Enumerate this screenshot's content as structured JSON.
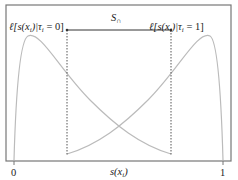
{
  "figure": {
    "label_left": "ℓ[s(x",
    "label_left_sub": "i",
    "label_left_mid": ")|τ",
    "label_left_sub2": "i",
    "label_left_end": " = 0]",
    "label_right": "ℓ[s(x",
    "label_right_sub": "i",
    "label_right_mid": ")|τ",
    "label_right_sub2": "i",
    "label_right_end": " = 1]",
    "interval_label": "S",
    "interval_sub": "∩",
    "x_axis_label": "s(x",
    "x_axis_label_sub": "i",
    "x_axis_label_end": ")",
    "tick_0": "0",
    "tick_1": "1"
  },
  "colors": {
    "frame": "#777777",
    "curve": "#bbbbbb",
    "dashed": "#555555",
    "arrow": "#333333"
  }
}
